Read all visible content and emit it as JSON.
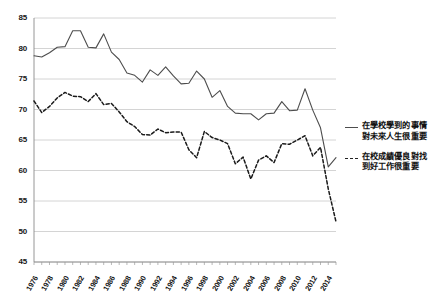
{
  "chart_data": {
    "type": "line",
    "title": "",
    "subtitle": "",
    "xlabel": "",
    "ylabel": "",
    "ylim": [
      45,
      85
    ],
    "yticks": [
      45,
      50,
      55,
      60,
      65,
      70,
      75,
      80,
      85
    ],
    "grid": true,
    "grid_axis": "y",
    "legend_position": "right",
    "x": [
      1976,
      1977,
      1978,
      1979,
      1980,
      1981,
      1982,
      1983,
      1984,
      1985,
      1986,
      1987,
      1988,
      1989,
      1990,
      1991,
      1992,
      1993,
      1994,
      1995,
      1996,
      1997,
      1998,
      1999,
      2000,
      2001,
      2002,
      2003,
      2004,
      2005,
      2006,
      2007,
      2008,
      2009,
      2010,
      2011,
      2012,
      2013,
      2014,
      2015
    ],
    "xticks": [
      "1976",
      "1978",
      "1980",
      "1982",
      "1984",
      "1986",
      "1988",
      "1990",
      "1992",
      "1994",
      "1996",
      "1998",
      "2000",
      "2002",
      "2004",
      "2006",
      "2008",
      "2010",
      "2012",
      "2014"
    ],
    "series": [
      {
        "name": "在學校學到的事情對未來人生很重要",
        "style": "solid",
        "color": "#4d4d4d",
        "values": [
          78.8,
          78.6,
          79.3,
          80.2,
          80.3,
          82.9,
          82.9,
          80.2,
          80.1,
          82.4,
          79.4,
          78.2,
          76.0,
          75.6,
          74.5,
          76.5,
          75.6,
          77.0,
          75.5,
          74.2,
          74.3,
          76.3,
          75.0,
          72.0,
          73.1,
          70.5,
          69.4,
          69.3,
          69.3,
          68.3,
          69.3,
          69.4,
          71.3,
          69.8,
          69.9,
          73.4,
          69.9,
          67.0,
          60.6,
          62.1
        ]
      },
      {
        "name": "在校成績優良對找到好工作很重要",
        "style": "dashed",
        "color": "#1a1a1a",
        "values": [
          71.4,
          69.5,
          70.5,
          71.9,
          72.8,
          72.2,
          72.1,
          71.3,
          72.6,
          70.8,
          71.0,
          69.6,
          68.0,
          67.2,
          65.9,
          65.8,
          66.8,
          66.2,
          66.3,
          66.3,
          63.4,
          62.1,
          66.4,
          65.4,
          65.0,
          64.4,
          61.1,
          62.2,
          58.6,
          61.7,
          62.4,
          61.3,
          64.4,
          64.3,
          65.0,
          65.7,
          62.4,
          63.8,
          57.0,
          51.6
        ]
      }
    ],
    "legend": [
      {
        "label_line1": "在學校學到的事情",
        "label_line2": "對未來人生很重要",
        "style": "solid"
      },
      {
        "label_line1": "在校成績優良對找",
        "label_line2": "到好工作很重要",
        "style": "dashed"
      }
    ]
  }
}
